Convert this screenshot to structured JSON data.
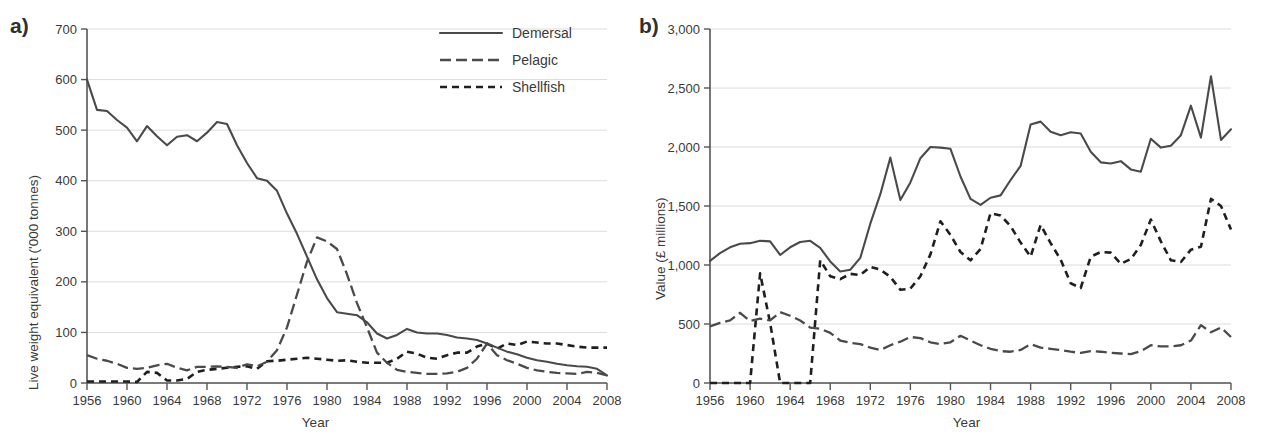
{
  "figure": {
    "panels": [
      {
        "key": "a",
        "label": "a)",
        "ylabel": "Live weight equivalent ('000 tonnes)",
        "xlabel": "Year",
        "has_legend": true
      },
      {
        "key": "b",
        "label": "b)",
        "ylabel": "Value (£ millions)",
        "xlabel": "Year",
        "has_legend": false
      }
    ],
    "legend": {
      "items": [
        {
          "name": "Demersal",
          "style": "solid"
        },
        {
          "name": "Pelagic",
          "style": "long-dash"
        },
        {
          "name": "Shellfish",
          "style": "short-dash"
        }
      ]
    }
  },
  "chart_data": [
    {
      "type": "line",
      "panel": "a",
      "title": "",
      "xlabel": "Year",
      "ylabel": "Live weight equivalent ('000 tonnes)",
      "xlim": [
        1956,
        2008
      ],
      "ylim": [
        0,
        700
      ],
      "xticks": [
        1956,
        1960,
        1964,
        1968,
        1972,
        1976,
        1980,
        1984,
        1988,
        1992,
        1996,
        2000,
        2004,
        2008
      ],
      "yticks": [
        0,
        100,
        200,
        300,
        400,
        500,
        600,
        700
      ],
      "grid": "horizontal",
      "legend": "top-right",
      "x": [
        1956,
        1957,
        1958,
        1959,
        1960,
        1961,
        1962,
        1963,
        1964,
        1965,
        1966,
        1967,
        1968,
        1969,
        1970,
        1971,
        1972,
        1973,
        1974,
        1975,
        1976,
        1977,
        1978,
        1979,
        1980,
        1981,
        1982,
        1983,
        1984,
        1985,
        1986,
        1987,
        1988,
        1989,
        1990,
        1991,
        1992,
        1993,
        1994,
        1995,
        1996,
        1997,
        1998,
        1999,
        2000,
        2001,
        2002,
        2003,
        2004,
        2005,
        2006,
        2007,
        2008
      ],
      "series": [
        {
          "name": "Demersal",
          "style": "solid",
          "values": [
            600,
            540,
            538,
            520,
            505,
            478,
            508,
            488,
            470,
            487,
            490,
            478,
            495,
            516,
            512,
            470,
            435,
            405,
            400,
            380,
            335,
            295,
            250,
            205,
            168,
            140,
            137,
            134,
            120,
            98,
            88,
            95,
            107,
            100,
            98,
            98,
            95,
            90,
            88,
            85,
            78,
            70,
            62,
            57,
            50,
            45,
            42,
            38,
            35,
            33,
            32,
            28,
            15
          ]
        },
        {
          "name": "Pelagic",
          "style": "long-dash",
          "values": [
            55,
            48,
            44,
            38,
            30,
            28,
            30,
            35,
            38,
            30,
            25,
            32,
            32,
            33,
            32,
            30,
            37,
            33,
            42,
            65,
            110,
            175,
            240,
            288,
            280,
            265,
            215,
            158,
            110,
            60,
            40,
            26,
            22,
            20,
            18,
            18,
            19,
            22,
            30,
            48,
            78,
            55,
            45,
            38,
            30,
            25,
            22,
            20,
            19,
            18,
            22,
            20,
            15
          ]
        },
        {
          "name": "Shellfish",
          "style": "short-dash",
          "values": [
            3,
            3,
            3,
            3,
            3,
            2,
            22,
            20,
            5,
            5,
            8,
            22,
            26,
            28,
            30,
            32,
            33,
            28,
            43,
            44,
            46,
            48,
            50,
            48,
            46,
            44,
            45,
            42,
            40,
            40,
            40,
            48,
            62,
            58,
            50,
            48,
            55,
            60,
            60,
            72,
            78,
            68,
            78,
            75,
            82,
            80,
            78,
            78,
            75,
            72,
            70,
            70,
            70
          ]
        }
      ]
    },
    {
      "type": "line",
      "panel": "b",
      "title": "",
      "xlabel": "Year",
      "ylabel": "Value (£ millions)",
      "xlim": [
        1956,
        2008
      ],
      "ylim": [
        0,
        3000
      ],
      "xticks": [
        1956,
        1960,
        1964,
        1968,
        1972,
        1976,
        1980,
        1984,
        1988,
        1992,
        1996,
        2000,
        2004,
        2008
      ],
      "yticks": [
        0,
        500,
        1000,
        1500,
        2000,
        2500,
        3000
      ],
      "grid": "horizontal",
      "legend": "none",
      "x": [
        1956,
        1957,
        1958,
        1959,
        1960,
        1961,
        1962,
        1963,
        1964,
        1965,
        1966,
        1967,
        1968,
        1969,
        1970,
        1971,
        1972,
        1973,
        1974,
        1975,
        1976,
        1977,
        1978,
        1979,
        1980,
        1981,
        1982,
        1983,
        1984,
        1985,
        1986,
        1987,
        1988,
        1989,
        1990,
        1991,
        1992,
        1993,
        1994,
        1995,
        1996,
        1997,
        1998,
        1999,
        2000,
        2001,
        2002,
        2003,
        2004,
        2005,
        2006,
        2007,
        2008
      ],
      "series": [
        {
          "name": "Demersal",
          "style": "solid",
          "values": [
            1035,
            1100,
            1150,
            1180,
            1185,
            1205,
            1200,
            1085,
            1150,
            1195,
            1205,
            1145,
            1030,
            945,
            960,
            1060,
            1350,
            1600,
            1910,
            1550,
            1700,
            1905,
            2000,
            1995,
            1985,
            1750,
            1560,
            1510,
            1570,
            1590,
            1720,
            1840,
            2190,
            2215,
            2130,
            2100,
            2125,
            2115,
            1960,
            1870,
            1860,
            1880,
            1810,
            1790,
            2070,
            1995,
            2010,
            2100,
            2350,
            2080,
            2600,
            2060,
            2150
          ]
        },
        {
          "name": "Pelagic",
          "style": "long-dash",
          "values": [
            480,
            510,
            530,
            595,
            525,
            545,
            530,
            600,
            570,
            530,
            470,
            460,
            425,
            360,
            340,
            330,
            300,
            280,
            320,
            350,
            390,
            380,
            345,
            330,
            345,
            400,
            360,
            320,
            290,
            270,
            265,
            280,
            330,
            300,
            290,
            280,
            265,
            255,
            270,
            265,
            255,
            250,
            245,
            270,
            320,
            310,
            310,
            320,
            360,
            490,
            430,
            470,
            390
          ]
        },
        {
          "name": "Shellfish",
          "style": "short-dash",
          "values": [
            0,
            0,
            0,
            0,
            0,
            930,
            510,
            0,
            0,
            0,
            0,
            1040,
            905,
            880,
            925,
            915,
            985,
            960,
            900,
            790,
            800,
            905,
            1090,
            1370,
            1255,
            1110,
            1040,
            1135,
            1440,
            1420,
            1330,
            1190,
            1070,
            1340,
            1185,
            1045,
            845,
            805,
            1070,
            1110,
            1105,
            1010,
            1050,
            1170,
            1385,
            1200,
            1040,
            1025,
            1130,
            1155,
            1560,
            1500,
            1300
          ]
        }
      ]
    }
  ]
}
